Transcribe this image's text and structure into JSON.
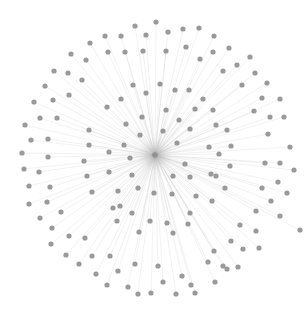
{
  "diagram": {
    "type": "star-network",
    "canvas": {
      "width": 308,
      "height": 309,
      "background": "#ffffff"
    },
    "style": {
      "node_color": "#8f8f8f",
      "node_radius": 2.6,
      "node_opacity": 0.9,
      "edge_color": "#bdbdbd",
      "edge_width": 0.45,
      "edge_opacity": 0.45,
      "hub_glow_color": "#9a9a9a"
    },
    "hub": {
      "id": "hub",
      "x": 155,
      "y": 155
    },
    "nodes": [
      [
        90,
        43
      ],
      [
        71,
        54
      ],
      [
        86,
        60
      ],
      [
        54,
        71
      ],
      [
        68,
        73
      ],
      [
        82,
        80
      ],
      [
        45,
        86
      ],
      [
        53,
        100
      ],
      [
        69,
        95
      ],
      [
        34,
        102
      ],
      [
        135,
        26
      ],
      [
        156,
        22
      ],
      [
        121,
        36
      ],
      [
        105,
        36
      ],
      [
        146,
        35
      ],
      [
        168,
        32
      ],
      [
        183,
        29
      ],
      [
        199,
        28
      ],
      [
        108,
        52
      ],
      [
        125,
        52
      ],
      [
        143,
        51
      ],
      [
        166,
        51
      ],
      [
        186,
        47
      ],
      [
        200,
        59
      ],
      [
        133,
        85
      ],
      [
        146,
        93
      ],
      [
        160,
        84
      ],
      [
        175,
        90
      ],
      [
        189,
        90
      ],
      [
        203,
        99
      ],
      [
        121,
        99
      ],
      [
        214,
        36
      ],
      [
        213,
        52
      ],
      [
        229,
        48
      ],
      [
        237,
        65
      ],
      [
        250,
        57
      ],
      [
        223,
        71
      ],
      [
        255,
        73
      ],
      [
        267,
        83
      ],
      [
        242,
        85
      ],
      [
        262,
        98
      ],
      [
        280,
        99
      ],
      [
        40,
        118
      ],
      [
        57,
        118
      ],
      [
        25,
        125
      ],
      [
        31,
        140
      ],
      [
        48,
        139
      ],
      [
        89,
        130
      ],
      [
        89,
        145
      ],
      [
        22,
        153
      ],
      [
        48,
        157
      ],
      [
        84,
        161
      ],
      [
        24,
        169
      ],
      [
        39,
        172
      ],
      [
        87,
        176
      ],
      [
        29,
        186
      ],
      [
        50,
        187
      ],
      [
        92,
        192
      ],
      [
        29,
        204
      ],
      [
        47,
        202
      ],
      [
        213,
        110
      ],
      [
        254,
        111
      ],
      [
        216,
        125
      ],
      [
        270,
        117
      ],
      [
        227,
        130
      ],
      [
        284,
        117
      ],
      [
        268,
        134
      ],
      [
        231,
        146
      ],
      [
        290,
        147
      ],
      [
        219,
        154
      ],
      [
        265,
        163
      ],
      [
        280,
        163
      ],
      [
        230,
        166
      ],
      [
        294,
        170
      ],
      [
        216,
        176
      ],
      [
        278,
        182
      ],
      [
        225,
        188
      ],
      [
        262,
        188
      ],
      [
        287,
        193
      ],
      [
        212,
        201
      ],
      [
        271,
        201
      ],
      [
        40,
        218
      ],
      [
        61,
        212
      ],
      [
        52,
        228
      ],
      [
        69,
        236
      ],
      [
        85,
        238
      ],
      [
        51,
        244
      ],
      [
        66,
        255
      ],
      [
        92,
        256
      ],
      [
        79,
        264
      ],
      [
        96,
        274
      ],
      [
        113,
        208
      ],
      [
        132,
        213
      ],
      [
        117,
        221
      ],
      [
        150,
        221
      ],
      [
        167,
        223
      ],
      [
        139,
        232
      ],
      [
        173,
        233
      ],
      [
        190,
        213
      ],
      [
        188,
        224
      ],
      [
        110,
        256
      ],
      [
        135,
        264
      ],
      [
        118,
        271
      ],
      [
        158,
        266
      ],
      [
        182,
        276
      ],
      [
        163,
        282
      ],
      [
        208,
        262
      ],
      [
        227,
        269
      ],
      [
        191,
        285
      ],
      [
        138,
        294
      ],
      [
        107,
        285
      ],
      [
        128,
        287
      ],
      [
        151,
        293
      ],
      [
        176,
        294
      ],
      [
        195,
        293
      ],
      [
        256,
        211
      ],
      [
        280,
        216
      ],
      [
        240,
        225
      ],
      [
        256,
        231
      ],
      [
        300,
        230
      ],
      [
        231,
        241
      ],
      [
        214,
        251
      ],
      [
        243,
        249
      ],
      [
        259,
        248
      ],
      [
        223,
        266
      ],
      [
        238,
        267
      ],
      [
        215,
        282
      ],
      [
        107,
        107
      ],
      [
        126,
        124
      ],
      [
        142,
        117
      ],
      [
        166,
        110
      ],
      [
        179,
        120
      ],
      [
        195,
        109
      ],
      [
        140,
        135
      ],
      [
        163,
        131
      ],
      [
        190,
        129
      ],
      [
        124,
        145
      ],
      [
        177,
        143
      ],
      [
        209,
        147
      ],
      [
        109,
        152
      ],
      [
        130,
        158
      ],
      [
        185,
        164
      ],
      [
        109,
        172
      ],
      [
        132,
        175
      ],
      [
        211,
        174
      ],
      [
        173,
        176
      ],
      [
        190,
        177
      ],
      [
        118,
        191
      ],
      [
        154,
        193
      ],
      [
        138,
        188
      ],
      [
        172,
        194
      ],
      [
        196,
        196
      ],
      [
        120,
        206
      ]
    ]
  }
}
